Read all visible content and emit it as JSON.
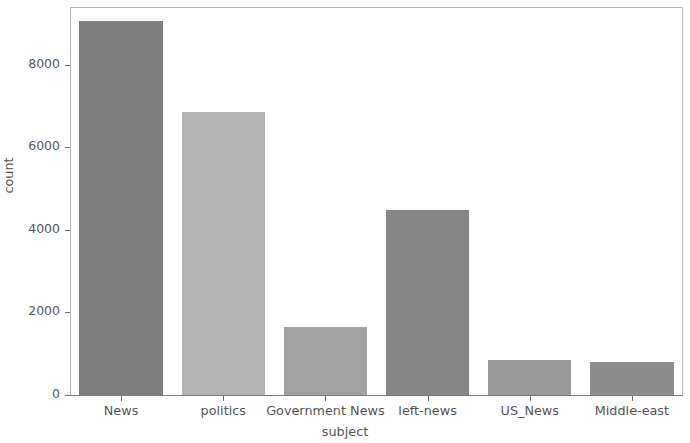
{
  "chart_data": {
    "type": "bar",
    "title": "",
    "xlabel": "subject",
    "ylabel": "count",
    "categories": [
      "News",
      "politics",
      "Government News",
      "left-news",
      "US_News",
      "Middle-east"
    ],
    "values": [
      9050,
      6850,
      1640,
      4490,
      840,
      790
    ],
    "ylim": [
      0,
      9400
    ],
    "yticks": [
      0,
      2000,
      4000,
      6000,
      8000
    ],
    "ytick_labels": [
      "0",
      "2000",
      "4000",
      "6000",
      "8000"
    ],
    "grid": false,
    "legend": null,
    "bar_colors": [
      "#7e7e7e",
      "#b2b2b2",
      "#a2a2a2",
      "#868686",
      "#9b9b9b",
      "#8d8d8d"
    ],
    "axis_color": "#b6b6b6",
    "text_color": "#545454"
  },
  "axes": {
    "x_title": "subject",
    "y_title": "count"
  }
}
